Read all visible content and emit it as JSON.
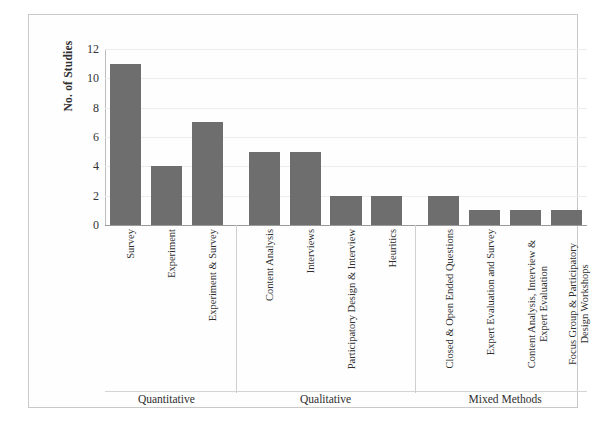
{
  "chart_data": {
    "type": "bar",
    "title": "",
    "xlabel": "",
    "ylabel": "No. of Studies",
    "ylim": [
      0,
      12
    ],
    "ytick_step": 2,
    "yticks": [
      "12",
      "10",
      "8",
      "6",
      "4",
      "2",
      "0"
    ],
    "grid": true,
    "legend": "none",
    "bar_color": "#6e6e6e",
    "orientation": "vertical",
    "categories": [
      "Survey",
      "Experiment",
      "Experiment & Survey",
      "Content Analysis",
      "Interviews",
      "Participatory Design & Interview",
      "Heuritics",
      "Closed & Open Ended Questions",
      "Expert Evaluation and Survey",
      "Content Analysis, Interview & Expert Evaluation",
      "Focus Group & Participatory Design Workshops"
    ],
    "values": [
      11,
      4,
      7,
      5,
      5,
      2,
      2,
      2,
      1,
      1,
      1
    ],
    "groups": [
      {
        "label": "Quantitative",
        "count": 3
      },
      {
        "label": "Qualitative",
        "count": 4
      },
      {
        "label": "Mixed Methods",
        "count": 4
      }
    ]
  }
}
